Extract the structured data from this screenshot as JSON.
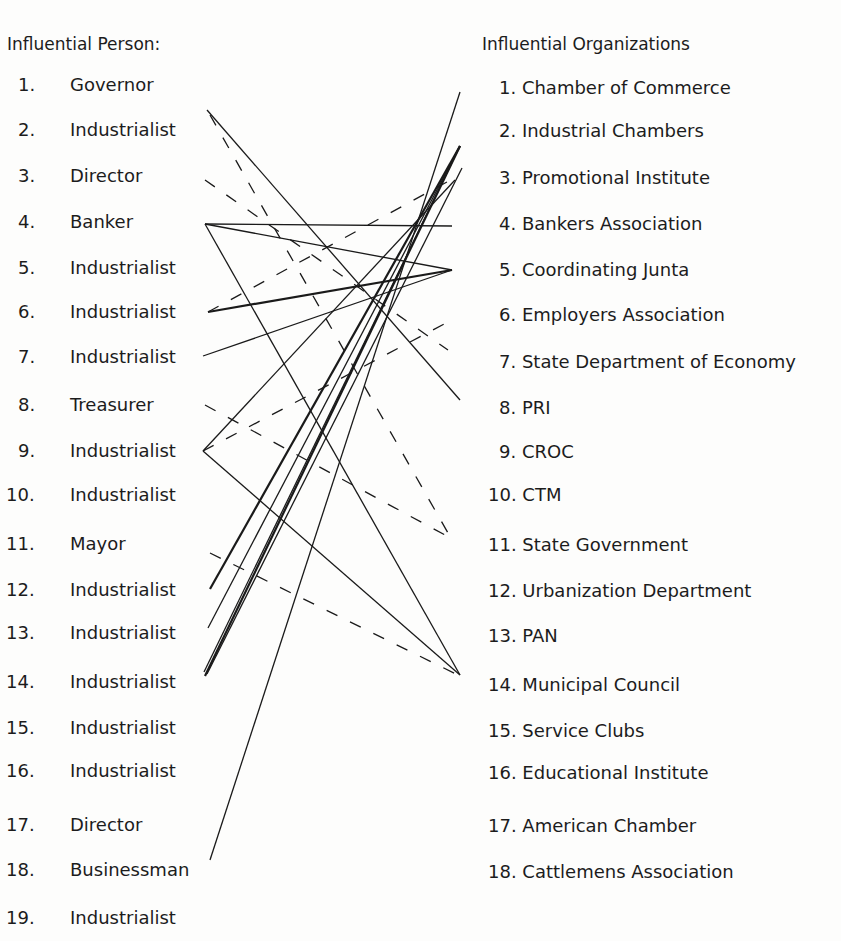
{
  "diagram": {
    "left_title": "Influential Person:",
    "right_title": "Influential Organizations",
    "persons": [
      {
        "num": "1.",
        "label": "Governor",
        "y": 85
      },
      {
        "num": "2.",
        "label": "Industrialist",
        "y": 130
      },
      {
        "num": "3.",
        "label": "Director",
        "y": 176
      },
      {
        "num": "4.",
        "label": "Banker",
        "y": 222
      },
      {
        "num": "5.",
        "label": "Industrialist",
        "y": 268
      },
      {
        "num": "6.",
        "label": "Industrialist",
        "y": 312
      },
      {
        "num": "7.",
        "label": "Industrialist",
        "y": 357
      },
      {
        "num": "8.",
        "label": "Treasurer",
        "y": 405
      },
      {
        "num": "9.",
        "label": "Industrialist",
        "y": 451
      },
      {
        "num": "10.",
        "label": "Industrialist",
        "y": 495
      },
      {
        "num": "11.",
        "label": "Mayor",
        "y": 544
      },
      {
        "num": "12.",
        "label": "Industrialist",
        "y": 590
      },
      {
        "num": "13.",
        "label": "Industrialist",
        "y": 633
      },
      {
        "num": "14.",
        "label": "Industrialist",
        "y": 682
      },
      {
        "num": "15.",
        "label": "Industrialist",
        "y": 728
      },
      {
        "num": "16.",
        "label": "Industrialist",
        "y": 771
      },
      {
        "num": "17.",
        "label": "Director",
        "y": 825
      },
      {
        "num": "18.",
        "label": "Businessman",
        "y": 870
      },
      {
        "num": "19.",
        "label": "Industrialist",
        "y": 918
      }
    ],
    "organizations": [
      {
        "label": "1. Chamber of Commerce",
        "y": 88
      },
      {
        "label": "2. Industrial Chambers",
        "y": 131
      },
      {
        "label": "3. Promotional Institute",
        "y": 178
      },
      {
        "label": "4. Bankers Association",
        "y": 224
      },
      {
        "label": "5. Coordinating Junta",
        "y": 270
      },
      {
        "label": "6. Employers Association",
        "y": 315
      },
      {
        "label": "7. State Department of Economy",
        "y": 362
      },
      {
        "label": "8. PRI",
        "y": 408
      },
      {
        "label": "9. CROC",
        "y": 452
      },
      {
        "label": "10. CTM",
        "y": 495
      },
      {
        "label": "11. State Government",
        "y": 545
      },
      {
        "label": "12. Urbanization Department",
        "y": 591
      },
      {
        "label": "13. PAN",
        "y": 636
      },
      {
        "label": "14. Municipal Council",
        "y": 685
      },
      {
        "label": "15. Service Clubs",
        "y": 731
      },
      {
        "label": "16. Educational Institute",
        "y": 773
      },
      {
        "label": "17. American Chamber",
        "y": 826
      },
      {
        "label": "18. Cattlemens Association",
        "y": 872
      }
    ],
    "links": [
      {
        "from": "2. Industrialist",
        "to": "8. PRI",
        "style": "solid",
        "x1": 207,
        "y1": 110,
        "x2": 460,
        "y2": 400
      },
      {
        "from": "2. Industrialist",
        "to": "11. State Government",
        "style": "dashed",
        "x1": 210,
        "y1": 115,
        "x2": 448,
        "y2": 533
      },
      {
        "from": "3. Director",
        "to": "7. State Department of Economy",
        "style": "dashed",
        "x1": 205,
        "y1": 180,
        "x2": 448,
        "y2": 350
      },
      {
        "from": "4. Banker",
        "to": "4. Bankers Association",
        "style": "solid",
        "x1": 205,
        "y1": 224,
        "x2": 452,
        "y2": 226
      },
      {
        "from": "4. Banker",
        "to": "5. Coordinating Junta",
        "style": "solid",
        "x1": 205,
        "y1": 224,
        "x2": 452,
        "y2": 270
      },
      {
        "from": "4. Banker",
        "to": "14. Municipal Council",
        "style": "solid",
        "x1": 205,
        "y1": 224,
        "x2": 460,
        "y2": 675
      },
      {
        "from": "6. Industrialist",
        "to": "5. Coordinating Junta",
        "style": "solid-bold",
        "x1": 208,
        "y1": 312,
        "x2": 452,
        "y2": 270
      },
      {
        "from": "6. Industrialist",
        "to": "3. Promotional Institute",
        "style": "dashed",
        "x1": 208,
        "y1": 312,
        "x2": 458,
        "y2": 176
      },
      {
        "from": "7. Industrialist",
        "to": "5. Coordinating Junta",
        "style": "solid",
        "x1": 203,
        "y1": 356,
        "x2": 452,
        "y2": 270
      },
      {
        "from": "8. Treasurer",
        "to": "11. State Government",
        "style": "dashed",
        "x1": 205,
        "y1": 405,
        "x2": 445,
        "y2": 535
      },
      {
        "from": "9. Industrialist",
        "to": "3. Promotional Institute",
        "style": "solid",
        "x1": 203,
        "y1": 451,
        "x2": 455,
        "y2": 180
      },
      {
        "from": "9. Industrialist",
        "to": "6. Employers Association",
        "style": "dashed",
        "x1": 203,
        "y1": 451,
        "x2": 448,
        "y2": 322
      },
      {
        "from": "9. Industrialist",
        "to": "14. Municipal Council",
        "style": "solid",
        "x1": 203,
        "y1": 451,
        "x2": 460,
        "y2": 675
      },
      {
        "from": "11. Mayor",
        "to": "14. Municipal Council",
        "style": "dashed",
        "x1": 210,
        "y1": 553,
        "x2": 458,
        "y2": 675
      },
      {
        "from": "12. Industrialist",
        "to": "2. Industrial Chambers",
        "style": "solid-bold",
        "x1": 210,
        "y1": 589,
        "x2": 460,
        "y2": 146
      },
      {
        "from": "13. Industrialist",
        "to": "2. Industrial Chambers",
        "style": "solid",
        "x1": 208,
        "y1": 628,
        "x2": 460,
        "y2": 146
      },
      {
        "from": "14. Industrialist",
        "to": "2. Industrial Chambers",
        "style": "solid-bold",
        "x1": 205,
        "y1": 676,
        "x2": 460,
        "y2": 146
      },
      {
        "from": "14. Industrialist",
        "to": "3. Promotional Institute",
        "style": "solid",
        "x1": 207,
        "y1": 674,
        "x2": 462,
        "y2": 168
      },
      {
        "from": "14. Industrialist",
        "to": "2. Industrial Chambers",
        "style": "solid",
        "x1": 204,
        "y1": 672,
        "x2": 458,
        "y2": 150
      },
      {
        "from": "18. Businessman",
        "to": "1. Chamber of Commerce",
        "style": "solid",
        "x1": 210,
        "y1": 860,
        "x2": 460,
        "y2": 92
      }
    ]
  }
}
